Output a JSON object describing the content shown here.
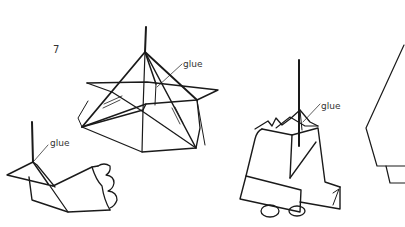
{
  "diagram": {
    "step_number": "7",
    "labels": {
      "star_glue": "glue",
      "bird_glue": "glue",
      "bell_glue": "glue"
    },
    "figures": [
      {
        "name": "star-ornament",
        "description": "pyramid star with vertical stick"
      },
      {
        "name": "bird-ornament",
        "description": "folded bird with scalloped tail and stick"
      },
      {
        "name": "bell-ornament",
        "description": "folded bell with clapper and stick"
      },
      {
        "name": "partial-figure",
        "description": "partially visible folded shape at right edge"
      }
    ],
    "colors": {
      "line": "#1a1a1a",
      "background": "#ffffff",
      "text": "#333333"
    }
  }
}
